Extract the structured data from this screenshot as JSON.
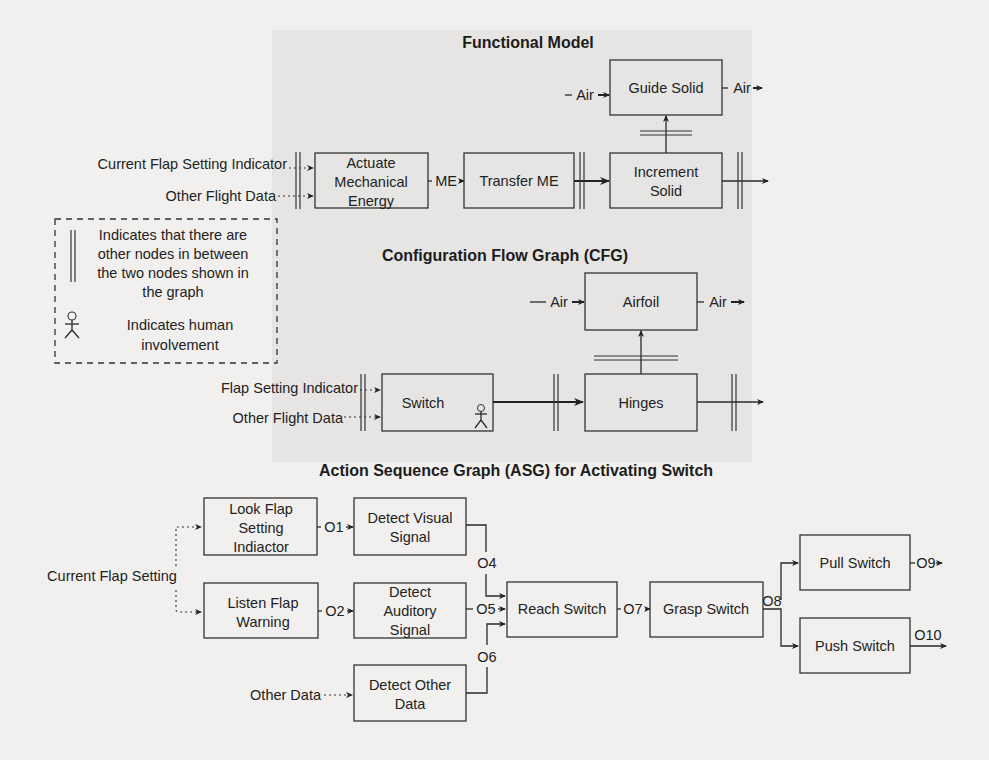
{
  "functional_model": {
    "title": "Functional Model",
    "inputs": [
      "Current Flap Setting Indicator",
      "Other Flight Data"
    ],
    "nodes": {
      "actuate": [
        "Actuate",
        "Mechanical",
        "Energy"
      ],
      "transfer": [
        "Transfer ME"
      ],
      "increment": [
        "Increment",
        "Solid"
      ],
      "guide": [
        "Guide Solid"
      ]
    },
    "flows": {
      "me": "ME",
      "air_in": "Air",
      "air_out": "Air"
    }
  },
  "legend": {
    "skip_text": [
      "Indicates that there are",
      "other nodes in between",
      "the two nodes shown in",
      "the graph"
    ],
    "human_text": [
      "Indicates human",
      "involvement"
    ]
  },
  "cfg": {
    "title": "Configuration Flow Graph (CFG)",
    "inputs": [
      "Flap Setting Indicator",
      "Other Flight Data"
    ],
    "nodes": {
      "switch": "Switch",
      "hinges": "Hinges",
      "airfoil": "Airfoil"
    },
    "flows": {
      "air_in": "Air",
      "air_out": "Air"
    }
  },
  "asg": {
    "title": "Action Sequence Graph (ASG) for Activating Switch",
    "inputs": {
      "current": "Current Flap Setting",
      "other": "Other Data"
    },
    "nodes": {
      "look": [
        "Look Flap",
        "Setting",
        "Indiactor"
      ],
      "listen": [
        "Listen Flap",
        "Warning"
      ],
      "visual": [
        "Detect Visual",
        "Signal"
      ],
      "auditory": [
        "Detect",
        "Auditory",
        "Signal"
      ],
      "other": [
        "Detect Other",
        "Data"
      ],
      "reach": [
        "Reach Switch"
      ],
      "grasp": [
        "Grasp Switch"
      ],
      "pull": [
        "Pull Switch"
      ],
      "push": [
        "Push Switch"
      ]
    },
    "outputs": {
      "o1": "O1",
      "o2": "O2",
      "o4": "O4",
      "o5": "O5",
      "o6": "O6",
      "o7": "O7",
      "o8": "O8",
      "o9": "O9",
      "o10": "O10"
    }
  }
}
